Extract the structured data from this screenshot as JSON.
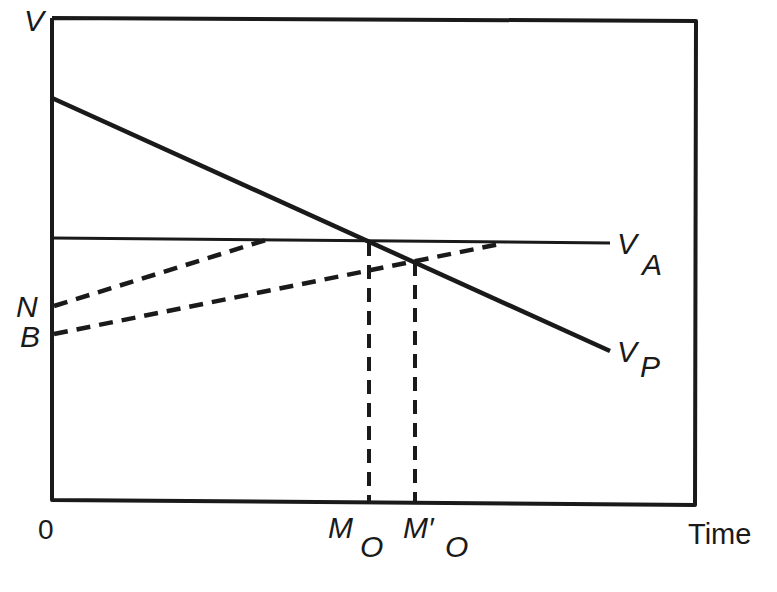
{
  "diagram": {
    "type": "economic-time-value-diagram",
    "axes": {
      "y_label": "V",
      "x_label": "Time",
      "origin_label": "0"
    },
    "lines": [
      {
        "name": "V_A",
        "label_main": "V",
        "label_sub": "A",
        "style": "solid",
        "description": "horizontal line"
      },
      {
        "name": "V_P",
        "label_main": "V",
        "label_sub": "P",
        "style": "solid",
        "description": "declining line"
      },
      {
        "name": "N-path",
        "label": "N",
        "style": "dashed",
        "description": "from N rising to V_A"
      },
      {
        "name": "B-path",
        "label": "B",
        "style": "dashed",
        "description": "from B rising to V_A"
      }
    ],
    "points": {
      "N": "N",
      "B": "B",
      "M_O_main": "M",
      "M_O_sub": "O",
      "M_prime_O_main": "M′",
      "M_prime_O_sub": "O"
    },
    "colors": {
      "ink": "#1a1a1a",
      "background": "#ffffff"
    }
  }
}
